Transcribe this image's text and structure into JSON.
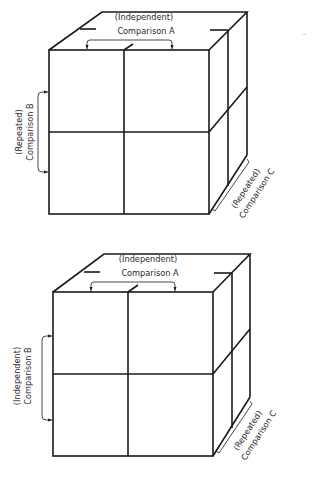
{
  "figure": {
    "diagrams": [
      {
        "id": "top",
        "labels": {
          "a_line1": "(Independent)",
          "a_line2": "Comparison  A",
          "b_line1": "(Repeated)",
          "b_line2": "Comparison  B",
          "c_line1": "(Repeated)",
          "c_line2": "Comparison  C"
        }
      },
      {
        "id": "bottom",
        "labels": {
          "a_line1": "(Independent)",
          "a_line2": "Comparison  A",
          "b_line1": "(Independent)",
          "b_line2": "Comparison  B",
          "c_line1": "(Repeated)",
          "c_line2": "Comparison  C"
        }
      }
    ],
    "colors": {
      "ink": "#1a1a1a",
      "background": "#ffffff"
    }
  }
}
